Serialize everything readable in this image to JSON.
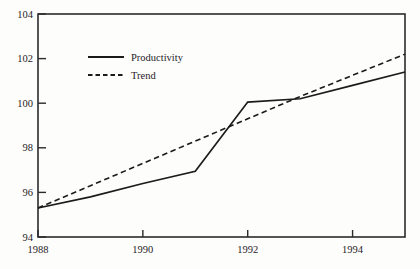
{
  "chart_data": {
    "type": "line",
    "title": "",
    "subtitle": "",
    "xlabel": "",
    "ylabel": "",
    "xlim": [
      1988,
      1995
    ],
    "ylim": [
      94,
      104
    ],
    "grid": false,
    "legend_position": "upper-left-inside",
    "x": [
      1988,
      1989,
      1990,
      1991,
      1992,
      1993,
      1994,
      1995
    ],
    "xtick_labels": [
      "1988",
      "1990",
      "1992",
      "1994"
    ],
    "xtick_values": [
      1988,
      1990,
      1992,
      1994
    ],
    "ytick_labels": [
      "94",
      "96",
      "98",
      "100",
      "102",
      "104"
    ],
    "ytick_values": [
      94,
      96,
      98,
      100,
      102,
      104
    ],
    "series": [
      {
        "name": "Productivity",
        "style": "solid",
        "color": "#1d1b1a",
        "values": [
          95.3,
          95.8,
          96.4,
          96.95,
          100.05,
          100.2,
          100.8,
          101.4
        ]
      },
      {
        "name": "Trend",
        "style": "dashed",
        "color": "#1d1b1a",
        "values": [
          95.3,
          96.3,
          97.3,
          98.3,
          99.3,
          100.3,
          101.25,
          102.2
        ]
      }
    ]
  },
  "legend": {
    "items": [
      {
        "label": "Productivity",
        "style": "solid"
      },
      {
        "label": "Trend",
        "style": "dashed"
      }
    ]
  },
  "axes": {
    "y_axis_name": "value-axis",
    "x_axis_name": "year-axis"
  }
}
